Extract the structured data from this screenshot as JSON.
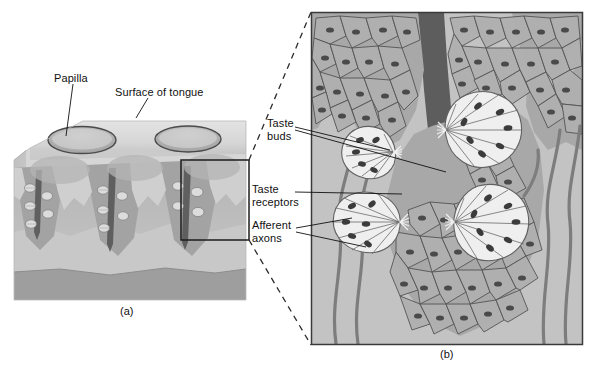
{
  "figure": {
    "background": "#ffffff"
  },
  "panel_a": {
    "letter": "(a)",
    "description": "Three-dimensional block of tongue tissue showing papillae and taste buds",
    "labels": [
      {
        "id": "papilla",
        "text": "Papilla"
      },
      {
        "id": "surface-of-tongue",
        "text": "Surface of tongue"
      }
    ],
    "selection_box": {
      "label": "magnified-region",
      "x": 181,
      "y": 160,
      "width": 68,
      "height": 80
    },
    "colors": {
      "top_surface": "#d9d9d9",
      "epithelium": "#b4b4b4",
      "papilla_core": "#9a9a9a",
      "connective": "#c6c6c6",
      "muscle_band": "#9e9e9e",
      "trench": "#5a5a5a",
      "outline": "#555555"
    }
  },
  "panel_b": {
    "letter": "(b)",
    "description": "Magnified cross-section of a papilla wall with taste buds, taste receptor cells and afferent axons",
    "labels": [
      {
        "id": "taste-buds",
        "line1": "Taste",
        "line2": "buds"
      },
      {
        "id": "taste-receptors",
        "line1": "Taste",
        "line2": "receptors"
      },
      {
        "id": "afferent-axons",
        "line1": "Afferent",
        "line2": "axons"
      }
    ],
    "frame": {
      "x": 311,
      "y": 12,
      "width": 272,
      "height": 333
    },
    "taste_bud_count": 4,
    "colors": {
      "background": "#c3c3c3",
      "epithelium": "#a8a8a8",
      "cell_fill": "#b0b0b0",
      "cell_outline": "#4f4f4f",
      "nucleus": "#4a4a4a",
      "taste_bud_fill": "#efefef",
      "taste_bud_outline": "#606060",
      "receptor_nucleus": "#3b3b3b",
      "trench": "#555555",
      "axon": "#7d7d7d",
      "frame_outline": "#3a3a3a"
    }
  },
  "connectors": {
    "style": "dashed",
    "color": "#333333",
    "count": 2
  }
}
